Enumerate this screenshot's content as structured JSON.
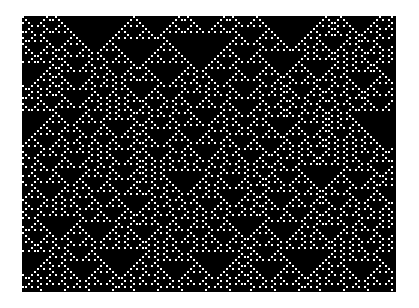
{
  "figure": {
    "colors": {
      "background": "#ffffff",
      "cell_off": "#000000",
      "cell_on": "#ffffff"
    },
    "region": {
      "left": 22,
      "top": 16,
      "width": 374,
      "height": 276
    },
    "cell_size": 3,
    "rule": 18,
    "seed": 1337,
    "initial_density": 0.12
  }
}
